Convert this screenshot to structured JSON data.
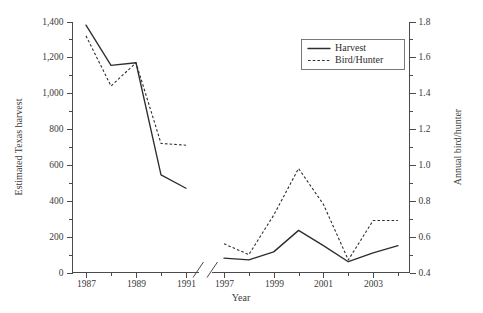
{
  "chart_data": {
    "type": "line",
    "title": "",
    "xlabel": "Year",
    "ylabel": "Estimated Texas harvest",
    "y2label": "Annual bird/hunter",
    "axis_break": true,
    "panels": [
      {
        "name": "panel-1987-1991",
        "x": [
          1987,
          1988,
          1989,
          1990,
          1991
        ],
        "xticks": [
          "1987",
          "1989",
          "1991"
        ],
        "series": [
          {
            "name": "Harvest",
            "axis": "left",
            "style": "solid",
            "values": [
              1380,
              1155,
              1170,
              545,
              470
            ]
          },
          {
            "name": "Bird/Hunter",
            "axis": "right",
            "style": "dashed",
            "values": [
              1.72,
              1.44,
              1.57,
              1.12,
              1.11
            ]
          }
        ]
      },
      {
        "name": "panel-1997-2004",
        "x": [
          1997,
          1998,
          1999,
          2000,
          2001,
          2002,
          2003,
          2004
        ],
        "xticks": [
          "1997",
          "1999",
          "2001",
          "2003"
        ],
        "series": [
          {
            "name": "Harvest",
            "axis": "left",
            "style": "solid",
            "values": [
              80,
              70,
              115,
              235,
              150,
              60,
              110,
              150
            ]
          },
          {
            "name": "Bird/Hunter",
            "axis": "right",
            "style": "dashed",
            "values": [
              0.56,
              0.5,
              0.72,
              0.98,
              0.78,
              0.47,
              0.69,
              0.69
            ]
          }
        ]
      }
    ],
    "ylim": [
      0,
      1400
    ],
    "yticks": [
      0,
      200,
      400,
      600,
      800,
      1000,
      1200,
      1400
    ],
    "yticklabels": [
      "0",
      "200",
      "400",
      "600",
      "800",
      "1,000",
      "1,200",
      "1,400"
    ],
    "y2lim": [
      0.4,
      1.8
    ],
    "y2ticks": [
      0.4,
      0.6,
      0.8,
      1.0,
      1.2,
      1.4,
      1.6,
      1.8
    ],
    "y2ticklabels": [
      "0.4",
      "0.6",
      "0.8",
      "1.0",
      "1.2",
      "1.4",
      "1.6",
      "1.8"
    ],
    "minor_ticks": true,
    "grid": false,
    "legend": {
      "position": "top-right",
      "entries": [
        {
          "label": "Harvest",
          "style": "solid"
        },
        {
          "label": "Bird/Hunter",
          "style": "dashed"
        }
      ]
    }
  },
  "labels": {
    "y_axis_title": "Estimated Texas harvest",
    "y2_axis_title": "Annual bird/hunter",
    "x_axis_title": "Year",
    "y_ticks": [
      "1,400",
      "1,200",
      "1,000",
      "800",
      "600",
      "400",
      "200",
      "0"
    ],
    "y2_ticks": [
      "1.8",
      "1.6",
      "1.4",
      "1.2",
      "1.0",
      "0.8",
      "0.6",
      "0.4"
    ],
    "x_ticks_left": [
      "1987",
      "1989",
      "1991"
    ],
    "x_ticks_right": [
      "1997",
      "1999",
      "2001",
      "2003"
    ],
    "legend_harvest": "Harvest",
    "legend_birdhunter": "Bird/Hunter"
  },
  "colors": {
    "ink": "#2e2e2e",
    "axis": "#4a4a4a",
    "background": "#ffffff"
  }
}
